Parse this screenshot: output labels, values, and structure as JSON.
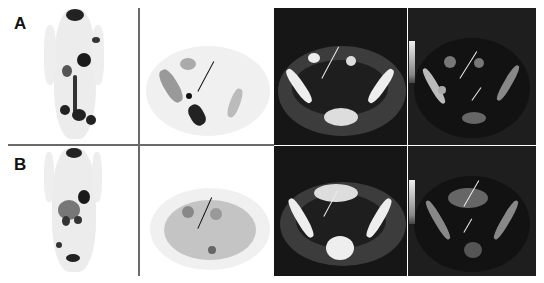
{
  "figure": {
    "rows": [
      {
        "label": "A",
        "panels": [
          "pet-mip-coronal",
          "pet-axial-pelvis",
          "ct-axial-pelvis",
          "fused-pet-ct-axial-pelvis"
        ]
      },
      {
        "label": "B",
        "panels": [
          "pet-mip-coronal",
          "pet-axial-pelvis",
          "ct-axial-pelvis",
          "fused-pet-ct-axial-pelvis"
        ]
      }
    ],
    "colors": {
      "background": "#ffffff",
      "divider": "#6a6a6a",
      "ct_background": "#141414",
      "pet_uptake": "#1a1a1a",
      "arrow_on_pet": "#111111",
      "arrow_on_ct": "#e8e8e8"
    }
  }
}
